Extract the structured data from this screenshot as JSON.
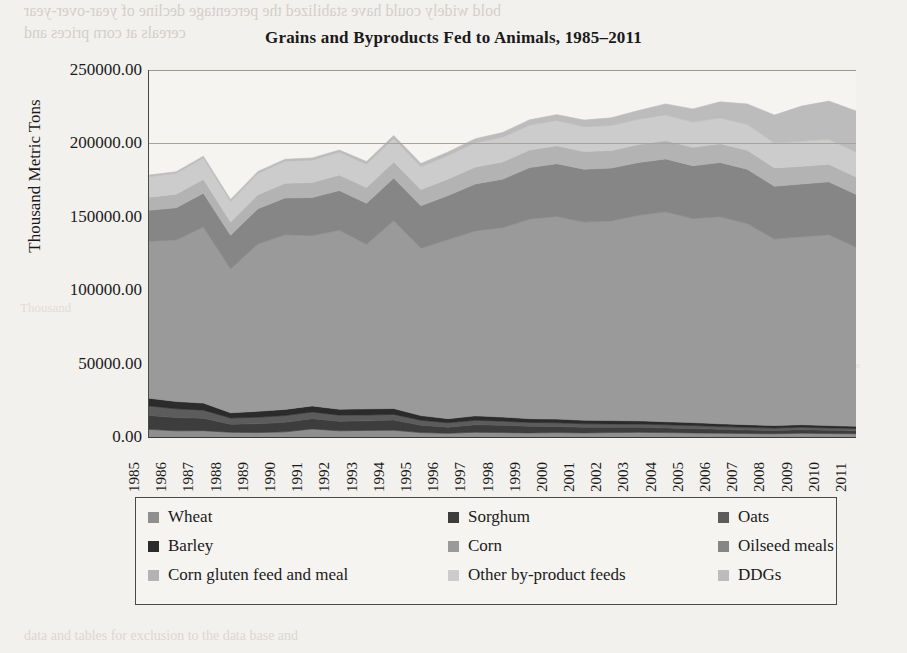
{
  "page": {
    "ghost_text": [
      "bold widely could have stabilized the percentage decline of year-over-year",
      "cereals at corn prices and",
      "Data sources and notes: 1985-2011",
      "grains and oilseeds are the",
      "animals in expansion",
      "rate of attainment",
      "data and tables for exclusion to the data base and",
      "Thousand",
      "Source"
    ]
  },
  "chart_data": {
    "type": "area",
    "stacked": true,
    "title": "Grains and Byproducts Fed to Animals, 1985–2011",
    "xlabel": "",
    "ylabel": "Thousand Metric Tons",
    "ylim": [
      0,
      250000
    ],
    "ytick_step": 50000,
    "ytick_labels": [
      "0.00",
      "50000.00",
      "100000.00",
      "150000.00",
      "200000.00",
      "250000.00"
    ],
    "ytick_values": [
      0,
      50000,
      100000,
      150000,
      200000,
      250000
    ],
    "grid": true,
    "legend_position": "bottom",
    "legend_columns": 3,
    "categories": [
      "1985",
      "1986",
      "1987",
      "1988",
      "1989",
      "1990",
      "1991",
      "1992",
      "1993",
      "1994",
      "1995",
      "1996",
      "1997",
      "1998",
      "1999",
      "2000",
      "2001",
      "2002",
      "2003",
      "2004",
      "2005",
      "2006",
      "2007",
      "2008",
      "2009",
      "2010",
      "2011"
    ],
    "series": [
      {
        "name": "Wheat",
        "color": "#8f8f8f",
        "values": [
          5200,
          4200,
          4300,
          3200,
          3000,
          3500,
          5500,
          4200,
          4500,
          4600,
          3000,
          2500,
          3200,
          3000,
          2800,
          3000,
          2800,
          3000,
          3200,
          3000,
          2800,
          2600,
          2400,
          2200,
          2600,
          2400,
          2200
        ]
      },
      {
        "name": "Sorghum",
        "color": "#3d3d3d",
        "values": [
          9500,
          9000,
          8500,
          5500,
          6000,
          6500,
          7000,
          6500,
          6500,
          7000,
          5000,
          4200,
          5200,
          5000,
          4500,
          4200,
          3800,
          3600,
          3400,
          3200,
          3000,
          2600,
          2400,
          2200,
          2400,
          2200,
          2000
        ]
      },
      {
        "name": "Oats",
        "color": "#5c5c5c",
        "values": [
          6500,
          6000,
          5500,
          4200,
          4500,
          4600,
          4500,
          4200,
          4000,
          3800,
          3400,
          3000,
          3000,
          2800,
          2600,
          2500,
          2400,
          2300,
          2200,
          2100,
          2000,
          1900,
          1800,
          1700,
          1700,
          1600,
          1600
        ]
      },
      {
        "name": "Barley",
        "color": "#2b2b2b",
        "values": [
          5200,
          5000,
          4800,
          3600,
          4000,
          4200,
          4200,
          4000,
          4200,
          4000,
          3200,
          2800,
          3000,
          2800,
          2600,
          2500,
          2400,
          2300,
          2200,
          2100,
          2000,
          1900,
          1800,
          1700,
          1700,
          1600,
          1500
        ]
      },
      {
        "name": "Corn",
        "color": "#9a9a9a",
        "values": [
          107000,
          110000,
          120000,
          98000,
          114000,
          119000,
          116000,
          122000,
          112000,
          128000,
          114000,
          122000,
          126000,
          129000,
          136000,
          138000,
          135000,
          136000,
          140000,
          143000,
          139000,
          141000,
          137000,
          127000,
          128000,
          130000,
          122000
        ]
      },
      {
        "name": "Oilseed meals",
        "color": "#868686",
        "values": [
          21000,
          22000,
          23000,
          23000,
          24000,
          25000,
          26000,
          27000,
          28000,
          29000,
          29000,
          30000,
          32000,
          33000,
          35000,
          36000,
          36000,
          36000,
          36000,
          36000,
          36000,
          37000,
          37000,
          36000,
          36000,
          36000,
          36000
        ]
      },
      {
        "name": "Corn gluten feed and meal",
        "color": "#b3b3b3",
        "values": [
          9000,
          9200,
          9500,
          9000,
          9500,
          10000,
          10200,
          10500,
          10800,
          11000,
          11000,
          11200,
          11500,
          11800,
          12000,
          12200,
          12000,
          12000,
          12200,
          12500,
          12500,
          12800,
          13000,
          12500,
          12000,
          12000,
          11800
        ]
      },
      {
        "name": "Other by-product feeds",
        "color": "#cccccc",
        "values": [
          14000,
          14200,
          14500,
          14000,
          14500,
          15000,
          15200,
          15500,
          15800,
          16000,
          15500,
          16000,
          16500,
          16800,
          17000,
          17200,
          17000,
          17000,
          17200,
          17500,
          17200,
          17500,
          17500,
          17000,
          17000,
          17000,
          17000
        ]
      },
      {
        "name": "DDGs",
        "color": "#bcbcbc",
        "values": [
          1000,
          1100,
          1200,
          1200,
          1300,
          1400,
          1500,
          1600,
          1800,
          2000,
          2200,
          2500,
          2800,
          3200,
          3600,
          4000,
          4500,
          5200,
          6000,
          7500,
          9000,
          11000,
          14000,
          19000,
          24000,
          26000,
          28000
        ]
      }
    ]
  }
}
